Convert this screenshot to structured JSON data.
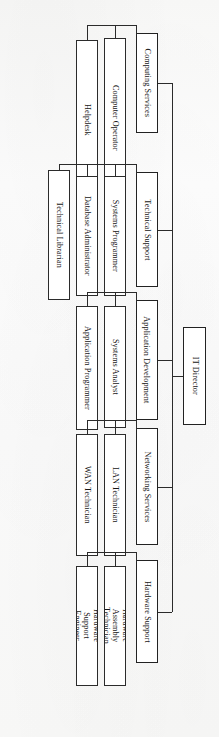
{
  "chart": {
    "orientation": "rotated-90-clockwise",
    "root": {
      "label": "IT Director"
    },
    "departments": [
      {
        "label": "Computing Services",
        "children": [
          {
            "label": "Computer Operator"
          },
          {
            "label": "Helpdesk"
          }
        ]
      },
      {
        "label": "Technical Support",
        "children": [
          {
            "label": "Systems Programmer"
          },
          {
            "label": "Database Administrator"
          },
          {
            "label": "Technical Librarian"
          }
        ]
      },
      {
        "label": "Application Development",
        "children": [
          {
            "label": "Systems Analyst"
          },
          {
            "label": "Application Programmer"
          }
        ]
      },
      {
        "label": "Networking Services",
        "children": [
          {
            "label": "LAN Technician"
          },
          {
            "label": "WAN Technician"
          }
        ]
      },
      {
        "label": "Hardware Support",
        "children": [
          {
            "label": "Hardware Assembly Technician"
          },
          {
            "label": "Hardware Support Engineer"
          }
        ]
      }
    ],
    "colors": {
      "border": "#2b2b2b",
      "box_fill": "#ffffff",
      "background": "#fbfbfb",
      "text": "#151515"
    }
  }
}
